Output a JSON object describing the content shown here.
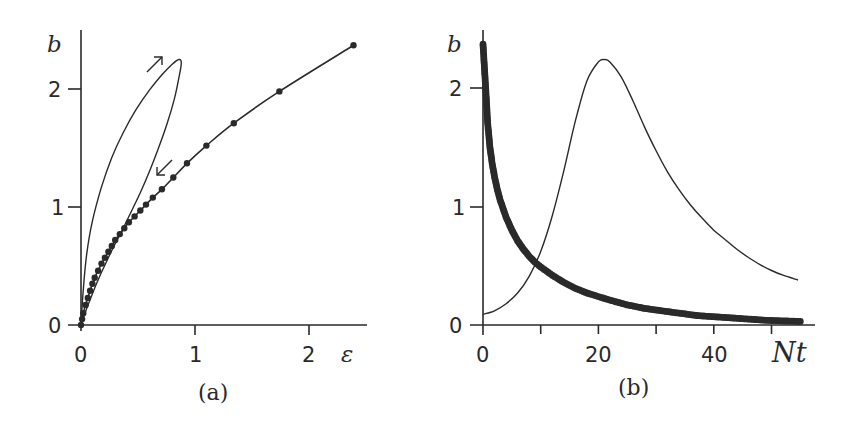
{
  "chart_data": [
    {
      "panel": "a",
      "type": "line",
      "panel_label": "(a)",
      "xlabel": "ε",
      "ylabel": "b",
      "xlim": [
        0,
        2.5
      ],
      "ylim": [
        0,
        2.5
      ],
      "x_ticks": [
        0,
        1,
        2
      ],
      "y_ticks": [
        0,
        1,
        2
      ],
      "grid": false,
      "annotations": [
        {
          "type": "arrow",
          "direction": "up-right",
          "near": [
            0.85,
            2.3
          ],
          "meaning": "loop traversal direction (outgoing)"
        },
        {
          "type": "arrow",
          "direction": "down-left",
          "near": [
            0.75,
            1.35
          ],
          "meaning": "return direction"
        }
      ],
      "series": [
        {
          "name": "loop (thin line)",
          "style": "thin-line",
          "x": [
            0.0,
            0.02,
            0.05,
            0.1,
            0.18,
            0.27,
            0.37,
            0.48,
            0.6,
            0.71,
            0.8,
            0.86,
            0.88,
            0.86,
            0.82,
            0.76,
            0.68,
            0.6,
            0.52,
            0.44,
            0.36,
            0.3,
            0.22,
            0.14,
            0.07,
            0.02,
            0.0
          ],
          "y": [
            0.0,
            0.3,
            0.6,
            0.88,
            1.17,
            1.42,
            1.63,
            1.82,
            1.99,
            2.12,
            2.21,
            2.25,
            2.22,
            2.1,
            1.92,
            1.72,
            1.5,
            1.3,
            1.12,
            0.96,
            0.8,
            0.69,
            0.53,
            0.36,
            0.19,
            0.06,
            0.0
          ]
        },
        {
          "name": "dotted trajectory (line with markers)",
          "style": "line-markers",
          "x": [
            2.39,
            1.74,
            1.34,
            1.1,
            0.93,
            0.81,
            0.71,
            0.63,
            0.57,
            0.52,
            0.47,
            0.42,
            0.38,
            0.34,
            0.3,
            0.27,
            0.24,
            0.21,
            0.18,
            0.15,
            0.12,
            0.1,
            0.08,
            0.06,
            0.04,
            0.02,
            0.01,
            0.0
          ],
          "y": [
            2.37,
            1.98,
            1.71,
            1.52,
            1.37,
            1.25,
            1.15,
            1.08,
            1.02,
            0.97,
            0.92,
            0.87,
            0.82,
            0.77,
            0.72,
            0.67,
            0.62,
            0.57,
            0.52,
            0.46,
            0.4,
            0.35,
            0.29,
            0.23,
            0.17,
            0.1,
            0.05,
            0.0
          ]
        }
      ]
    },
    {
      "panel": "b",
      "type": "line",
      "panel_label": "(b)",
      "xlabel": "Nt",
      "ylabel": "b",
      "xlim": [
        0,
        56
      ],
      "ylim": [
        0,
        2.5
      ],
      "x_ticks": [
        0,
        10,
        20,
        30,
        40,
        50
      ],
      "x_tick_labels": [
        "0",
        "",
        "20",
        "",
        "40",
        ""
      ],
      "y_ticks": [
        0,
        1,
        2
      ],
      "grid": false,
      "series": [
        {
          "name": "pulse (thin line)",
          "style": "thin-line",
          "x": [
            0,
            2,
            4,
            6,
            8,
            10,
            12,
            14,
            16,
            18,
            20,
            21,
            22,
            24,
            26,
            28,
            30,
            32,
            34,
            36,
            38,
            40,
            42,
            44,
            46,
            48,
            50,
            52,
            54.6
          ],
          "y": [
            0.09,
            0.12,
            0.18,
            0.27,
            0.41,
            0.62,
            0.92,
            1.3,
            1.72,
            2.06,
            2.22,
            2.24,
            2.22,
            2.09,
            1.89,
            1.67,
            1.47,
            1.29,
            1.14,
            1.01,
            0.9,
            0.8,
            0.72,
            0.64,
            0.57,
            0.51,
            0.46,
            0.42,
            0.38
          ]
        },
        {
          "name": "decay (dense markers)",
          "style": "line-markers",
          "x": [
            0,
            0.5,
            0.8,
            1.2,
            1.6,
            2.0,
            2.5,
            3,
            3.5,
            4,
            5,
            6,
            7,
            8,
            9,
            10,
            12,
            14,
            16,
            18,
            20,
            22,
            25,
            28,
            31,
            34,
            37,
            40,
            43,
            46,
            49,
            52,
            55
          ],
          "y": [
            2.37,
            1.97,
            1.71,
            1.5,
            1.36,
            1.25,
            1.14,
            1.05,
            0.98,
            0.91,
            0.8,
            0.71,
            0.64,
            0.58,
            0.53,
            0.49,
            0.42,
            0.36,
            0.31,
            0.27,
            0.24,
            0.21,
            0.17,
            0.14,
            0.12,
            0.1,
            0.08,
            0.07,
            0.06,
            0.05,
            0.04,
            0.035,
            0.03
          ]
        }
      ]
    }
  ],
  "figure": {
    "panel_a": {
      "label": "(a)",
      "y_var": "b",
      "x_var": "ε",
      "y_tick_labels": [
        "0",
        "1",
        "2"
      ],
      "x_tick_labels": [
        "0",
        "1",
        "2"
      ]
    },
    "panel_b": {
      "label": "(b)",
      "y_var": "b",
      "x_var": "Nt",
      "y_tick_labels": [
        "0",
        "1",
        "2"
      ],
      "x_tick_labels": [
        "0",
        "20",
        "40"
      ]
    }
  }
}
